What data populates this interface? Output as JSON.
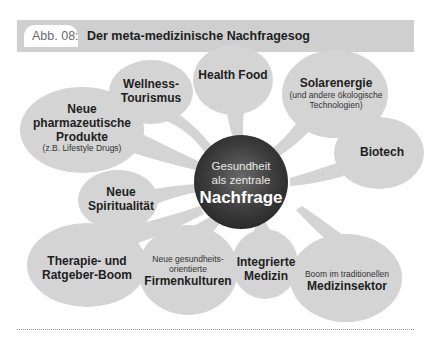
{
  "figure": {
    "label": "Abb. 08:",
    "title": "Der meta-medizinische Nachfragesog"
  },
  "center": {
    "line1": "Gesundheit",
    "line2": "als zentrale",
    "line3": "Nachfrage"
  },
  "bubbles": [
    {
      "id": "wellness",
      "lines": [
        "Wellness-",
        "Tourismus"
      ],
      "sub": ""
    },
    {
      "id": "health-food",
      "lines": [
        "Health Food"
      ],
      "sub": ""
    },
    {
      "id": "solarenergie",
      "lines": [
        "Solarenergie"
      ],
      "sub": "(und andere ökologische Technologien)",
      "sub1": "(und andere ökologische",
      "sub2": "Technologien)"
    },
    {
      "id": "pharma",
      "lines": [
        "Neue",
        "pharmazeutische",
        "Produkte"
      ],
      "sub": "(z.B. Lifestyle Drugs)"
    },
    {
      "id": "biotech",
      "lines": [
        "Biotech"
      ],
      "sub": ""
    },
    {
      "id": "spiritualitaet",
      "lines": [
        "Neue",
        "Spiritualität"
      ],
      "sub": ""
    },
    {
      "id": "therapie",
      "lines": [
        "Therapie- und",
        "Ratgeber-Boom"
      ],
      "sub": ""
    },
    {
      "id": "firmenkulturen",
      "pre1": "Neue gesundheits-",
      "pre2": "orientierte",
      "lines": [
        "Firmenkulturen"
      ]
    },
    {
      "id": "integrierte-medizin",
      "lines": [
        "Integrierte",
        "Medizin"
      ],
      "sub": ""
    },
    {
      "id": "medizinsektor",
      "pre1": "Boom im traditionellen",
      "lines": [
        "Medizinsektor"
      ]
    }
  ],
  "colors": {
    "bubble_fill": "#d4d4d4",
    "header_bar": "#cfcfcf",
    "center_dark": "#3a3a3a",
    "text": "#1e1e1e"
  }
}
